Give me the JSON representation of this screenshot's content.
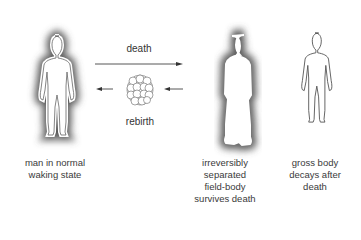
{
  "diagram": {
    "arrow_top_label": "death",
    "arrow_bottom_label": "rebirth",
    "figures": [
      {
        "id": "normal",
        "label_lines": [
          "man in normal",
          "waking state"
        ]
      },
      {
        "id": "field-body",
        "label_lines": [
          "irreversibly",
          "separated",
          "field-body",
          "survives death"
        ]
      },
      {
        "id": "gross-body",
        "label_lines": [
          "gross body",
          "decays after",
          "death"
        ]
      }
    ],
    "colors": {
      "aura": "#6a6a6a",
      "outline": "#555555",
      "text": "#333333",
      "background": "#ffffff"
    }
  }
}
